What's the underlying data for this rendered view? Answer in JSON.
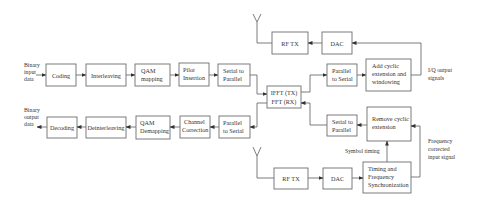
{
  "diagram": {
    "colors": {
      "stroke": "#6e6e6e",
      "text": "#333333",
      "background": "#ffffff"
    },
    "transmitter": {
      "input_label": [
        "Binary",
        "input",
        "data"
      ],
      "blocks": [
        {
          "id": "coding",
          "lines": [
            "Coding"
          ]
        },
        {
          "id": "interleaving",
          "lines": [
            "Interleaving"
          ]
        },
        {
          "id": "qam-mapping",
          "lines": [
            "QAM",
            "mapping"
          ]
        },
        {
          "id": "pilot-insertion",
          "lines": [
            "Pilot",
            "Insertion"
          ]
        },
        {
          "id": "serial-to-parallel-tx",
          "lines": [
            "Serial to",
            "Parallel"
          ]
        },
        {
          "id": "parallel-to-serial-tx",
          "lines": [
            "Parallel",
            "to Serial"
          ]
        },
        {
          "id": "add-cyclic",
          "lines": [
            "Add cyclic",
            "extension and",
            "windowing"
          ]
        },
        {
          "id": "dac-tx",
          "lines": [
            "DAC"
          ]
        },
        {
          "id": "rf-tx-top",
          "lines": [
            "RF TX"
          ]
        }
      ],
      "output_label": [
        "I/Q output",
        "signals"
      ]
    },
    "fft_block": {
      "lines": [
        "IFFT (TX)",
        "FFT (RX)"
      ]
    },
    "receiver": {
      "output_label": [
        "Binary",
        "output",
        "data"
      ],
      "blocks": [
        {
          "id": "decoding",
          "lines": [
            "Decoding"
          ]
        },
        {
          "id": "deinterleaving",
          "lines": [
            "Deinterleaving"
          ]
        },
        {
          "id": "qam-demapping",
          "lines": [
            "QAM",
            "Demapping"
          ]
        },
        {
          "id": "channel-correction",
          "lines": [
            "Channel",
            "Correction"
          ]
        },
        {
          "id": "parallel-to-serial-rx",
          "lines": [
            "Parallel",
            "to Serial"
          ]
        },
        {
          "id": "serial-to-parallel-rx",
          "lines": [
            "Serial to",
            "Parallel"
          ]
        },
        {
          "id": "remove-cyclic",
          "lines": [
            "Remove cyclic",
            "extension"
          ]
        },
        {
          "id": "timing-sync",
          "lines": [
            "Timing and",
            "Frequency",
            "Synchronization"
          ]
        },
        {
          "id": "dac-rx",
          "lines": [
            "DAC"
          ]
        },
        {
          "id": "rf-tx-bottom",
          "lines": [
            "RF TX"
          ]
        }
      ],
      "symbol_timing_label": "Symbol timing",
      "freq_corrected_label": [
        "Frequency",
        "corrected",
        "input signal"
      ]
    }
  }
}
